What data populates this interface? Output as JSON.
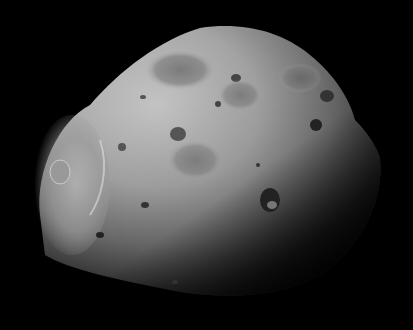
{
  "image": {
    "subject": "cratered moon (irregular rocky body) against black space",
    "palette": {
      "background": "#000000",
      "highlight": "#c8c8c8",
      "midtone": "#8a8a8a",
      "shadow": "#2a2a2a"
    }
  }
}
